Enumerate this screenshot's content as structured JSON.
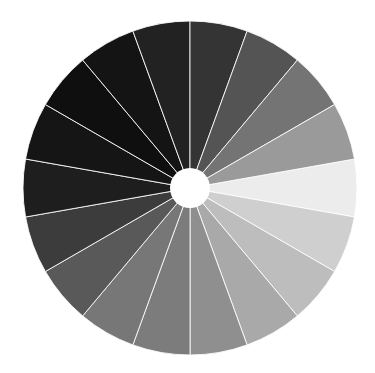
{
  "wheel": {
    "title": "grayscale color wheel",
    "center": [
      190,
      188
    ],
    "outer_radius": 167,
    "inner_radius": 20,
    "start_angle_deg": -10,
    "segment_span_deg": 20,
    "separator_color": "#ffffff",
    "hole_color": "#ffffff",
    "segments": [
      {
        "color": "#ececec"
      },
      {
        "color": "#cfcfcf"
      },
      {
        "color": "#bdbdbd"
      },
      {
        "color": "#a9a9a9"
      },
      {
        "color": "#8f8f8f"
      },
      {
        "color": "#7c7c7c"
      },
      {
        "color": "#777777"
      },
      {
        "color": "#595959"
      },
      {
        "color": "#3c3c3c"
      },
      {
        "color": "#1e1e1e"
      },
      {
        "color": "#151515"
      },
      {
        "color": "#0f0f0f"
      },
      {
        "color": "#141414"
      },
      {
        "color": "#222222"
      },
      {
        "color": "#343434"
      },
      {
        "color": "#545454"
      },
      {
        "color": "#747474"
      },
      {
        "color": "#9a9a9a"
      }
    ]
  }
}
